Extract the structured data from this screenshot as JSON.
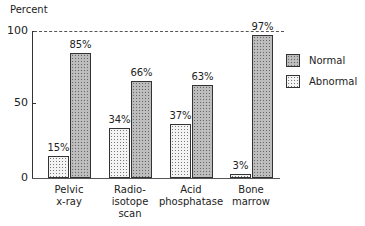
{
  "chart_data": {
    "type": "bar",
    "title": "",
    "ylabel": "Percent",
    "xlabel": "",
    "ylim": [
      0,
      100
    ],
    "yticks": [
      "0",
      "50",
      "100"
    ],
    "reference_line": {
      "value": 100,
      "style": "dashed"
    },
    "categories": [
      "Pelvic x-ray",
      "Radio-isotope scan",
      "Acid phosphatase",
      "Bone marrow"
    ],
    "category_lines": [
      [
        "Pelvic",
        "x-ray"
      ],
      [
        "Radio-",
        "isotope",
        "scan"
      ],
      [
        "Acid",
        "phosphatase"
      ],
      [
        "Bone",
        "marrow"
      ]
    ],
    "series": [
      {
        "name": "Abnormal",
        "values": [
          15,
          34,
          37,
          3
        ],
        "labels": [
          "15%",
          "34%",
          "37%",
          "3%"
        ],
        "pattern": "light-dotted"
      },
      {
        "name": "Normal",
        "values": [
          85,
          66,
          63,
          97
        ],
        "labels": [
          "85%",
          "66%",
          "63%",
          "97%"
        ],
        "pattern": "dark-crosshatch"
      }
    ],
    "legend": {
      "position": "right",
      "entries": [
        "Normal",
        "Abnormal"
      ]
    },
    "grid": false
  }
}
